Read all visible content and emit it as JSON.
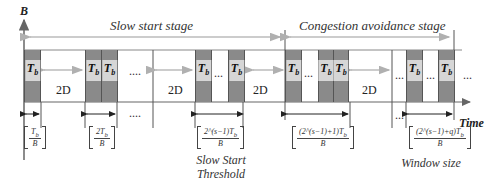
{
  "diagram": {
    "y_axis_label": "B",
    "x_axis_label": "Time",
    "stages": [
      {
        "label": "Slow start stage"
      },
      {
        "label": "Congestion avoidance stage"
      }
    ],
    "block_label": "T",
    "block_label_sub": "b",
    "gap_label": "2D",
    "ellipsis_long": "....",
    "ellipsis_short": "...",
    "fractions": [
      {
        "numerator": "T",
        "numerator_sub": "b",
        "denominator": "B"
      },
      {
        "numerator": "2T",
        "numerator_sub": "b",
        "denominator": "B"
      },
      {
        "numerator": "2^(s−1)T",
        "numerator_sub": "b",
        "denominator": "B"
      },
      {
        "numerator": "(2^(s−1)+1)T",
        "numerator_sub": "b",
        "denominator": "B"
      },
      {
        "numerator": "(2^(s−1)+q)T",
        "numerator_sub": "b",
        "denominator": "B"
      }
    ],
    "captions": {
      "threshold_line1": "Slow Start",
      "threshold_line2": "Threshold",
      "window": "Window size"
    },
    "colors": {
      "block_fill": "#8a8a8a",
      "label_box": "#d6d6d6",
      "arrow_light": "#b8b8b8",
      "line": "#555555"
    }
  }
}
